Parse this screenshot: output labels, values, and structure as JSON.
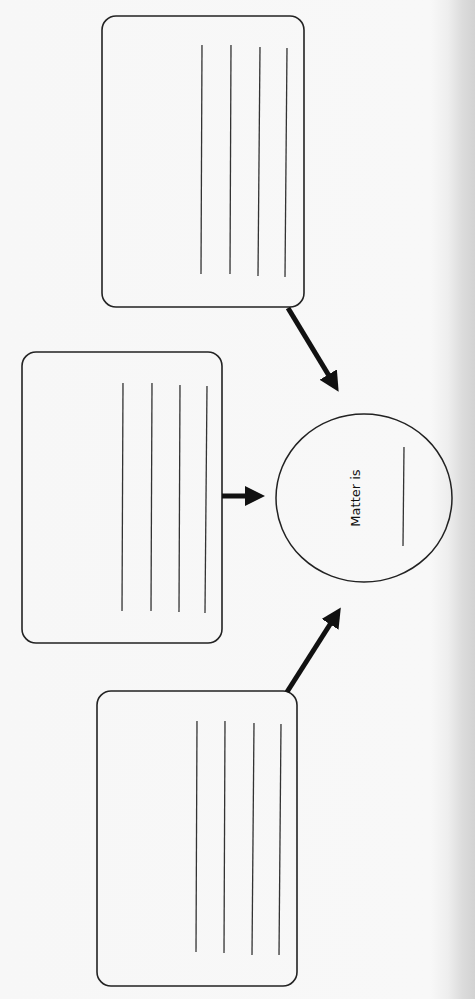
{
  "worksheet": {
    "title": "Matter graphic organizer",
    "center": {
      "label": "Matter is",
      "answer_blank": ""
    },
    "boxes": [
      {
        "position": "top",
        "lines": 4,
        "answers": [
          "",
          "",
          "",
          ""
        ]
      },
      {
        "position": "middle",
        "lines": 4,
        "answers": [
          "",
          "",
          "",
          ""
        ]
      },
      {
        "position": "bottom",
        "lines": 4,
        "answers": [
          "",
          "",
          "",
          ""
        ]
      }
    ],
    "arrows": [
      {
        "from": "top-box",
        "to": "center-circle"
      },
      {
        "from": "middle-box",
        "to": "center-circle"
      },
      {
        "from": "bottom-box",
        "to": "center-circle"
      }
    ],
    "colors": {
      "ink": "#111111",
      "paper": "#f8f8f8",
      "scan_shadow": "#d2d2d2"
    }
  }
}
